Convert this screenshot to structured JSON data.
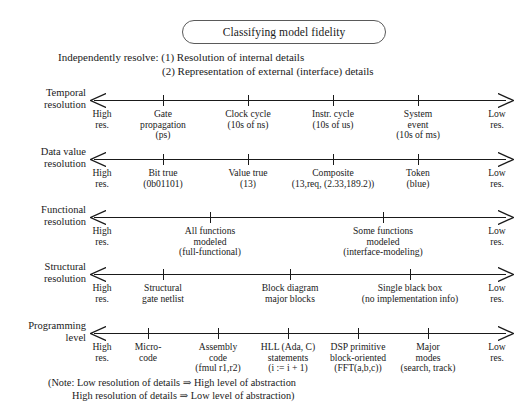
{
  "title": {
    "text": "Classifying model fidelity"
  },
  "intro": {
    "line1": "Independently resolve: (1) Resolution of internal details",
    "line2": "(2) Representation of external (interface) details"
  },
  "endpoints": {
    "high_l1": "High",
    "high_l2": "res.",
    "low_l1": "Low",
    "low_l2": "res."
  },
  "rows": [
    {
      "label_line1": "Temporal",
      "label_line2": "resolution",
      "y": 100,
      "ticks": [
        163,
        248,
        333,
        418
      ],
      "captions": [
        {
          "x": 163,
          "lines": [
            "Gate",
            "propagation",
            "(ps)"
          ]
        },
        {
          "x": 248,
          "lines": [
            "Clock cycle",
            "(10s of ns)"
          ]
        },
        {
          "x": 333,
          "lines": [
            "Instr. cycle",
            "(10s of us)"
          ]
        },
        {
          "x": 418,
          "lines": [
            "System",
            "event",
            "(10s of ms)"
          ]
        }
      ]
    },
    {
      "label_line1": "Data value",
      "label_line2": "resolution",
      "y": 159,
      "ticks": [
        163,
        248,
        333,
        418
      ],
      "captions": [
        {
          "x": 163,
          "lines": [
            "Bit true",
            "(0b01101)"
          ]
        },
        {
          "x": 248,
          "lines": [
            "Value true",
            "(13)"
          ]
        },
        {
          "x": 333,
          "lines": [
            "Composite",
            "(13,req, (2.33,189.2))"
          ]
        },
        {
          "x": 418,
          "lines": [
            "Token",
            "(blue)"
          ]
        }
      ]
    },
    {
      "label_line1": "Functional",
      "label_line2": "resolution",
      "y": 217,
      "ticks": [
        210,
        383
      ],
      "captions": [
        {
          "x": 210,
          "lines": [
            "All functions",
            "modeled",
            "(full-functional)"
          ]
        },
        {
          "x": 383,
          "lines": [
            "Some functions",
            "modeled",
            "(interface-modeling)"
          ]
        }
      ]
    },
    {
      "label_line1": "Structural",
      "label_line2": "resolution",
      "y": 274,
      "ticks": [
        163,
        290,
        410
      ],
      "captions": [
        {
          "x": 163,
          "lines": [
            "Structural",
            "gate netlist"
          ]
        },
        {
          "x": 290,
          "lines": [
            "Block diagram",
            "major blocks"
          ]
        },
        {
          "x": 410,
          "lines": [
            "Single black box",
            "(no implementation info)"
          ]
        }
      ]
    },
    {
      "label_line1": "Programming",
      "label_line2": "level",
      "y": 333,
      "ticks": [
        148,
        218,
        288,
        358,
        428
      ],
      "captions": [
        {
          "x": 148,
          "lines": [
            "Micro-",
            "code"
          ]
        },
        {
          "x": 218,
          "lines": [
            "Assembly",
            "code",
            "(fmul r1,r2)"
          ]
        },
        {
          "x": 288,
          "lines": [
            "HLL (Ada, C)",
            "statements",
            "(i := i + 1)"
          ]
        },
        {
          "x": 358,
          "lines": [
            "DSP primitive",
            "block-oriented",
            "(FFT(a,b,c))"
          ]
        },
        {
          "x": 428,
          "lines": [
            "Major",
            "modes",
            "(search, track)"
          ]
        }
      ]
    }
  ],
  "note": {
    "line1": "(Note: Low resolution of details ⇒ High level of abstraction",
    "line2": "High resolution of details ⇒ Low level of abstraction)"
  }
}
